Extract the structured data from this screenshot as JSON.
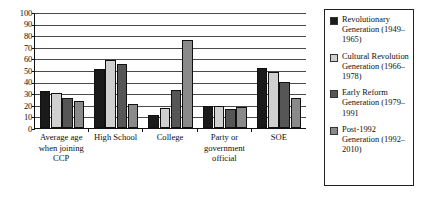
{
  "chart_data": {
    "type": "bar",
    "title": "",
    "subtitle": "",
    "xlabel": "",
    "ylabel": "",
    "ylim": [
      0,
      100
    ],
    "yticks": [
      100,
      90,
      80,
      70,
      60,
      50,
      40,
      30,
      20,
      10,
      0
    ],
    "grid": "horizontal",
    "legend_position": "right",
    "categories": [
      "Average age when joining CCP",
      "High School",
      "College",
      "Party or government official",
      "SOE"
    ],
    "series": [
      {
        "name": "Revolutionary Generation (1949–1965)",
        "color": "#1a1a1a",
        "values": [
          32,
          51,
          11,
          19,
          52
        ]
      },
      {
        "name": "Cultural Revolution Generation (1966–1978)",
        "color": "#d0d0d0",
        "values": [
          30,
          59,
          17,
          19,
          48
        ]
      },
      {
        "name": "Early Reform Generation (1979–1991",
        "color": "#565656",
        "values": [
          26,
          55,
          33,
          16,
          40
        ]
      },
      {
        "name": "Post-1992 Generation (1992–2010)",
        "color": "#8a8a8a",
        "values": [
          23,
          21,
          76,
          18,
          26
        ]
      }
    ]
  },
  "axis": {
    "y_tick_labels": [
      "100",
      "90",
      "80",
      "70",
      "60",
      "50",
      "40",
      "30",
      "20",
      "10",
      "0"
    ]
  },
  "categories_display": [
    "Average age when joining CCP",
    "High School",
    "College",
    "Party or government official",
    "SOE"
  ],
  "legend": {
    "entries": [
      {
        "label": "Revolutionary Generation (1949–1965)",
        "color": "#1a1a1a"
      },
      {
        "label": "Cultural Revolution Generation (1966–1978)",
        "color": "#d0d0d0"
      },
      {
        "label": "Early Reform Generation (1979–1991",
        "color": "#565656"
      },
      {
        "label": "Post-1992 Generation (1992–2010)",
        "color": "#8a8a8a"
      }
    ]
  }
}
